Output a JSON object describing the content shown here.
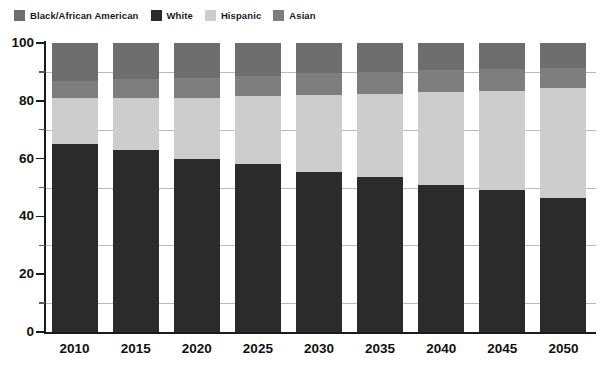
{
  "legend": {
    "position": "top-left",
    "items": [
      {
        "label": "Black/African American",
        "color": "#6e6e6e",
        "key": "black"
      },
      {
        "label": "White",
        "color": "#2b2b2b",
        "key": "white"
      },
      {
        "label": "Hispanic",
        "color": "#cdcdcd",
        "key": "hispanic"
      },
      {
        "label": "Asian",
        "color": "#7e7e7e",
        "key": "asian"
      }
    ]
  },
  "axes": {
    "y_ticks": [
      "0",
      "20",
      "40",
      "60",
      "80",
      "100"
    ],
    "y_minor_ticks": [
      "10",
      "30",
      "50",
      "70",
      "90"
    ],
    "x_ticks": [
      "2010",
      "2015",
      "2020",
      "2025",
      "2030",
      "2035",
      "2040",
      "2045",
      "2050"
    ]
  },
  "chart_data": {
    "type": "bar",
    "subtype": "stacked-percentage",
    "title": "",
    "subtitle": "",
    "xlabel": "",
    "ylabel": "",
    "ylim": [
      0,
      100
    ],
    "xlim_categories": 9,
    "grid": "horizontal-faint",
    "legend_position": "top-left",
    "stack_order_bottom_to_top": [
      "White",
      "Hispanic",
      "Asian",
      "Black/African American"
    ],
    "categories": [
      "2010",
      "2015",
      "2020",
      "2025",
      "2030",
      "2035",
      "2040",
      "2045",
      "2050"
    ],
    "series": [
      {
        "name": "White",
        "color": "#2b2b2b",
        "values": [
          65,
          63,
          60,
          58,
          55.5,
          53.5,
          51,
          49,
          46.5
        ]
      },
      {
        "name": "Hispanic",
        "color": "#cdcdcd",
        "values": [
          16,
          18,
          21,
          23.5,
          26.5,
          29,
          32,
          34.5,
          38
        ]
      },
      {
        "name": "Asian",
        "color": "#7e7e7e",
        "values": [
          6,
          6.5,
          7,
          7,
          7.5,
          7.5,
          7.5,
          7.5,
          7
        ]
      },
      {
        "name": "Black/African American",
        "color": "#6e6e6e",
        "values": [
          13,
          12.5,
          12,
          11.5,
          10.5,
          10,
          9.5,
          9,
          8.5
        ]
      }
    ],
    "cumulative_tops": {
      "white": [
        65,
        63,
        60,
        58,
        55.5,
        53.5,
        51,
        49,
        46.5
      ],
      "hispanic": [
        81,
        81,
        81,
        81.5,
        82,
        82.5,
        83,
        83.5,
        84.5
      ],
      "asian": [
        87,
        87.5,
        88,
        88.5,
        89.5,
        90,
        90.5,
        91,
        91.5
      ],
      "black": [
        100,
        100,
        100,
        100,
        100,
        100,
        100,
        100,
        100
      ]
    }
  },
  "colors": {
    "black_african_american": "#6e6e6e",
    "white": "#2b2b2b",
    "hispanic": "#cdcdcd",
    "asian": "#7e7e7e",
    "axis": "#1b1b1b",
    "gridline": "#b9b9b9",
    "background": "#ffffff"
  }
}
